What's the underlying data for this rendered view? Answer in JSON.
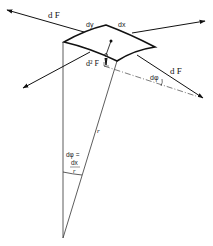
{
  "diagram": {
    "labels": {
      "force_top_left": "d F",
      "edge_dy": "dy",
      "edge_dx": "dx",
      "normal_force": "d² F",
      "force_bottom_right": "d F",
      "angle_small": "dφ",
      "radius": "r",
      "angle_eq_lhs": "dφ =",
      "angle_eq_num": "dx",
      "angle_eq_den": "r"
    },
    "colors": {
      "stroke": "#111111",
      "thin_stroke": "#444444",
      "background": "#ffffff"
    }
  }
}
